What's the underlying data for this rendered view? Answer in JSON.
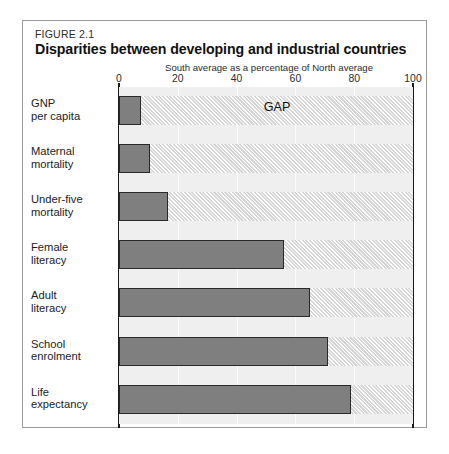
{
  "figure": {
    "number": "FIGURE 2.1",
    "title": "Disparities between developing and industrial countries"
  },
  "gap_label": "GAP",
  "chart_data": {
    "type": "bar",
    "orientation": "horizontal",
    "title": "Disparities between developing and industrial countries",
    "xlabel": "South average as a percentage of North average",
    "ylabel": "",
    "xlim": [
      0,
      100
    ],
    "xticks": [
      "0",
      "20",
      "40",
      "60",
      "80",
      "100"
    ],
    "xtick_values": [
      0,
      20,
      40,
      60,
      80,
      100
    ],
    "grid": true,
    "legend": false,
    "annotations": [
      "GAP"
    ],
    "categories": [
      "GNP\nper capita",
      "Maternal\nmortality",
      "Under-five\nmortality",
      "Female\nliteracy",
      "Adult\nliteracy",
      "School\nenrolment",
      "Life\nexpectancy"
    ],
    "values": [
      7.5,
      10.5,
      16.5,
      56,
      65,
      71,
      79
    ],
    "gap_values": [
      92.5,
      89.5,
      83.5,
      44,
      35,
      29,
      21
    ]
  },
  "colors": {
    "bar_fill": "#7f7f7f",
    "bar_border": "#2a2a2a",
    "plot_background": "#efefef",
    "gap_hatch": "#d6d6d6",
    "frame_border": "#9a9a9a",
    "axis_line": "#1a1a1a",
    "text": "#1c1c1c"
  }
}
